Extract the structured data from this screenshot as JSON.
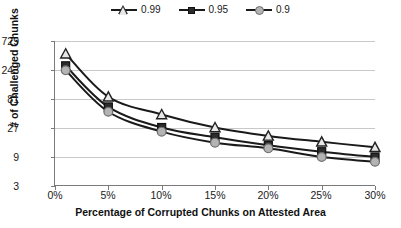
{
  "chart_data": {
    "type": "line",
    "title": "",
    "xlabel": "Percentage of Corrupted Chunks on Attested Area",
    "ylabel": "# of Challenged Chunks",
    "x": [
      1,
      5,
      10,
      15,
      20,
      25,
      30
    ],
    "xtick_labels": [
      "0%",
      "5%",
      "10%",
      "15%",
      "20%",
      "25%",
      "30%"
    ],
    "xtick_values": [
      0,
      5,
      10,
      15,
      20,
      25,
      30
    ],
    "xlim": [
      0,
      30
    ],
    "ytick_labels": [
      "3",
      "9",
      "27",
      "81",
      "243",
      "729"
    ],
    "ytick_values": [
      3,
      9,
      27,
      81,
      243,
      729
    ],
    "ylim": [
      3,
      729
    ],
    "yscale": "log3",
    "grid": "horizontal",
    "legend_position": "top-center",
    "series": [
      {
        "name": "0.99",
        "marker": "triangle",
        "marker_color": "#e8e8e8",
        "line_color": "#1a1a1a",
        "values": [
          450,
          88,
          45,
          27.5,
          20,
          16,
          13
        ]
      },
      {
        "name": "0.95",
        "marker": "square",
        "marker_color": "#2b2b2b",
        "line_color": "#1a1a1a",
        "values": [
          285,
          60,
          27.5,
          19,
          14,
          11,
          9
        ]
      },
      {
        "name": "0.9",
        "marker": "circle",
        "marker_color": "#b3b3b3",
        "line_color": "#1a1a1a",
        "values": [
          240,
          50,
          23.5,
          15.5,
          12.5,
          9,
          7.5
        ]
      }
    ]
  },
  "legend": {
    "items": [
      {
        "label": "0.99"
      },
      {
        "label": "0.95"
      },
      {
        "label": "0.9"
      }
    ]
  },
  "axes": {
    "y_title": "# of Challenged Chunks",
    "x_title": "Percentage of Corrupted Chunks on Attested Area"
  }
}
